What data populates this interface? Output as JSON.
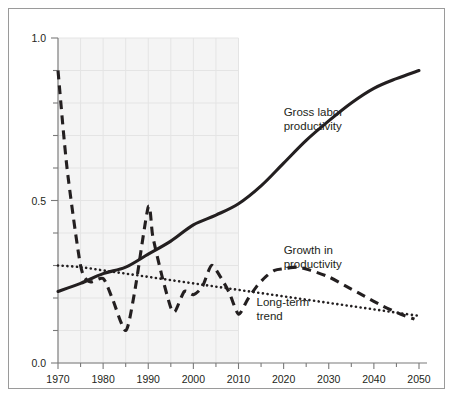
{
  "figure": {
    "caption": "",
    "frame_color": "#9a9a9a",
    "background": "#ffffff",
    "shaded_band_color": "#f4f4f4",
    "grid_color": "#e8e8e8",
    "ink_color": "#231f20"
  },
  "chart_data": {
    "type": "line",
    "title": "",
    "xlabel": "",
    "ylabel": "",
    "xlim": [
      1970,
      2050
    ],
    "ylim": [
      0.0,
      1.0
    ],
    "grid": true,
    "legend_position": "inline-annotations",
    "x_ticks": [
      1970,
      1980,
      1990,
      2000,
      2010,
      2020,
      2030,
      2040,
      2050
    ],
    "x_tick_labels": [
      "1970",
      "1980",
      "1990",
      "2000",
      "2010",
      "2020",
      "2030",
      "2040",
      "2050"
    ],
    "x_minor_tick_interval": 5,
    "y_ticks": [
      0.0,
      0.5,
      1.0
    ],
    "y_tick_labels": [
      "0.0",
      "0.5",
      "1.0"
    ],
    "y_minor_tick_interval": 0.1,
    "historical_band": [
      1970,
      2010
    ],
    "series": [
      {
        "name": "Gross labor productivity",
        "style": "solid",
        "annotation": "Gross labor\nproductivity",
        "annotation_lines": [
          "Gross labor",
          "productivity"
        ],
        "annotation_x": 2020,
        "annotation_y": 0.76,
        "x": [
          1970,
          1975,
          1980,
          1985,
          1990,
          1995,
          2000,
          2005,
          2010,
          2015,
          2020,
          2025,
          2030,
          2035,
          2040,
          2045,
          2050
        ],
        "y": [
          0.22,
          0.245,
          0.275,
          0.295,
          0.335,
          0.375,
          0.425,
          0.455,
          0.49,
          0.545,
          0.615,
          0.685,
          0.745,
          0.8,
          0.845,
          0.875,
          0.9
        ]
      },
      {
        "name": "Growth in productivity",
        "style": "dashed",
        "annotation": "Growth in\nproductivity",
        "annotation_lines": [
          "Growth in",
          "productivity"
        ],
        "annotation_x": 2020,
        "annotation_y": 0.335,
        "x": [
          1970,
          1972,
          1975,
          1977,
          1980,
          1982,
          1985,
          1987,
          1990,
          1991,
          1993,
          1995,
          1996,
          1998,
          2000,
          2002,
          2004,
          2006,
          2008,
          2010,
          2012,
          2014,
          2016,
          2018,
          2020,
          2023,
          2026,
          2030,
          2034,
          2038,
          2042,
          2046,
          2049
        ],
        "y": [
          0.9,
          0.6,
          0.3,
          0.25,
          0.26,
          0.2,
          0.1,
          0.22,
          0.48,
          0.39,
          0.27,
          0.17,
          0.16,
          0.22,
          0.21,
          0.235,
          0.3,
          0.265,
          0.215,
          0.15,
          0.195,
          0.235,
          0.265,
          0.285,
          0.29,
          0.295,
          0.285,
          0.265,
          0.235,
          0.205,
          0.175,
          0.15,
          0.135
        ]
      },
      {
        "name": "Long-term trend",
        "style": "dotted",
        "annotation": "Long-term\ntrend",
        "annotation_lines": [
          "Long-term",
          "trend"
        ],
        "annotation_x": 2014,
        "annotation_y": 0.175,
        "x": [
          1970,
          1975,
          1980,
          1985,
          1990,
          1995,
          2000,
          2005,
          2010,
          2015,
          2020,
          2025,
          2030,
          2035,
          2040,
          2045,
          2050
        ],
        "y": [
          0.3,
          0.295,
          0.285,
          0.275,
          0.265,
          0.255,
          0.245,
          0.235,
          0.225,
          0.215,
          0.205,
          0.195,
          0.185,
          0.175,
          0.165,
          0.155,
          0.145
        ]
      }
    ]
  }
}
